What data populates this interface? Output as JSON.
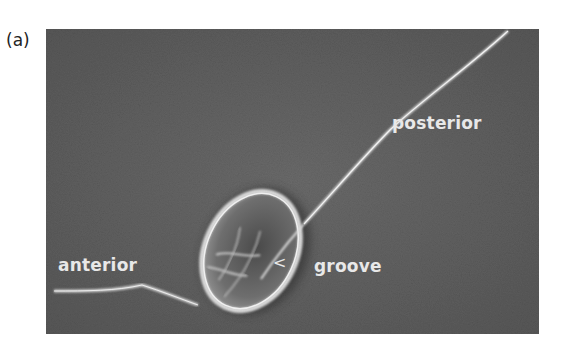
{
  "figure": {
    "panel_label": "(a)",
    "labels": {
      "posterior": "posterior",
      "anterior": "anterior",
      "groove": "groove",
      "groove_marker": "<"
    },
    "colors": {
      "background": "#5e5e5e",
      "flagellum": "#d8d8d8",
      "cell": "#bcbcbc",
      "text": "#e8e8e8"
    }
  }
}
